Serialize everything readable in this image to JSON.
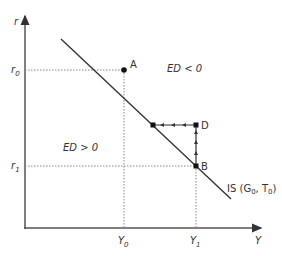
{
  "diagram": {
    "axes": {
      "y_label": "r",
      "x_label": "Y",
      "y_ticks": [
        {
          "base": "r",
          "sub": "0"
        },
        {
          "base": "r",
          "sub": "1"
        }
      ],
      "x_ticks": [
        {
          "base": "Y",
          "sub": "0"
        },
        {
          "base": "Y",
          "sub": "1"
        }
      ]
    },
    "points": {
      "A": "A",
      "B": "B",
      "D": "D"
    },
    "regions": {
      "above": "ED < 0",
      "below": "ED > 0"
    },
    "curve": {
      "label_prefix": "IS (G",
      "g_sub": "0",
      "mid": ", T",
      "t_sub": "0",
      "label_suffix": ")"
    },
    "colors": {
      "line": "#333333",
      "dotted": "#888888"
    }
  }
}
